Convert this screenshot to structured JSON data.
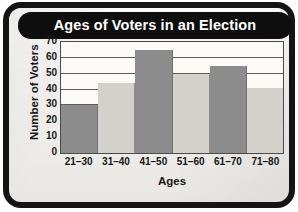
{
  "frame": {
    "border_color": "#141414",
    "paper_color": "#f2f0ec"
  },
  "banner": {
    "title": "Ages of Voters in an Election",
    "background": "#0e0e0e",
    "text_color": "#ffffff"
  },
  "chart_data": {
    "type": "bar",
    "title": "Ages of Voters in an Election",
    "subtitle": "",
    "xlabel": "Ages",
    "ylabel": "Number of Voters",
    "categories": [
      "21–30",
      "31–40",
      "41–50",
      "51–60",
      "61–70",
      "71–80"
    ],
    "values": [
      30,
      44,
      65,
      50,
      55,
      41
    ],
    "ylim": [
      0,
      70
    ],
    "ytick_labels": [
      "0",
      "10",
      "20",
      "30",
      "40",
      "50",
      "60",
      "70"
    ],
    "ytick_values": [
      0,
      10,
      20,
      30,
      40,
      50,
      60,
      70
    ],
    "ytick_interval": 10,
    "grid": "horizontal",
    "legend": "none",
    "bar_gap": 0,
    "bar_colors": [
      "#8c8c8c",
      "#d2d1cc",
      "#8c8c8c",
      "#d2d1cc",
      "#8c8c8c",
      "#d2d1cc"
    ],
    "gridline_color": "#5c5c5c",
    "plot_border_color": "#4a4a4a",
    "plot_background": "#fbfaf7"
  }
}
